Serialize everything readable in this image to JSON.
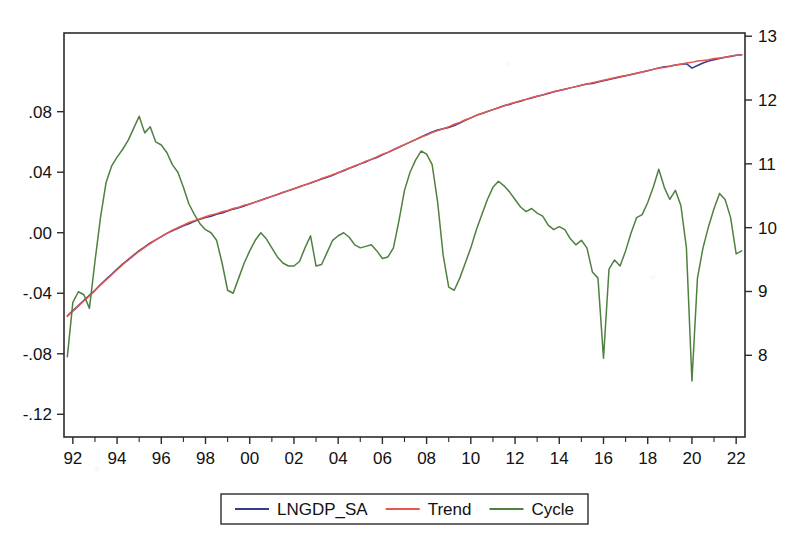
{
  "chart_data": {
    "type": "line",
    "title": "",
    "subtitle": "",
    "xlabel": "",
    "ylabel": "",
    "grid": false,
    "legend_position": "bottom-center",
    "x": [
      1991.75,
      1992.0,
      1992.25,
      1992.5,
      1992.75,
      1993.0,
      1993.25,
      1993.5,
      1993.75,
      1994.0,
      1994.25,
      1994.5,
      1994.75,
      1995.0,
      1995.25,
      1995.5,
      1995.75,
      1996.0,
      1996.25,
      1996.5,
      1996.75,
      1997.0,
      1997.25,
      1997.5,
      1997.75,
      1998.0,
      1998.25,
      1998.5,
      1998.75,
      1999.0,
      1999.25,
      1999.5,
      1999.75,
      2000.0,
      2000.25,
      2000.5,
      2000.75,
      2001.0,
      2001.25,
      2001.5,
      2001.75,
      2002.0,
      2002.25,
      2002.5,
      2002.75,
      2003.0,
      2003.25,
      2003.5,
      2003.75,
      2004.0,
      2004.25,
      2004.5,
      2004.75,
      2005.0,
      2005.25,
      2005.5,
      2005.75,
      2006.0,
      2006.25,
      2006.5,
      2006.75,
      2007.0,
      2007.25,
      2007.5,
      2007.75,
      2008.0,
      2008.25,
      2008.5,
      2008.75,
      2009.0,
      2009.25,
      2009.5,
      2009.75,
      2010.0,
      2010.25,
      2010.5,
      2010.75,
      2011.0,
      2011.25,
      2011.5,
      2011.75,
      2012.0,
      2012.25,
      2012.5,
      2012.75,
      2013.0,
      2013.25,
      2013.5,
      2013.75,
      2014.0,
      2014.25,
      2014.5,
      2014.75,
      2015.0,
      2015.25,
      2015.5,
      2015.75,
      2016.0,
      2016.25,
      2016.5,
      2016.75,
      2017.0,
      2017.25,
      2017.5,
      2017.75,
      2018.0,
      2018.25,
      2018.5,
      2018.75,
      2019.0,
      2019.25,
      2019.5,
      2019.75,
      2020.0,
      2020.25,
      2020.5,
      2020.75,
      2021.0,
      2021.25,
      2021.5,
      2021.75,
      2022.0,
      2022.25
    ],
    "x_axis": {
      "ticks": [
        "92",
        "94",
        "96",
        "98",
        "00",
        "02",
        "04",
        "06",
        "08",
        "10",
        "12",
        "14",
        "16",
        "18",
        "20",
        "22"
      ],
      "tick_values": [
        1992,
        1994,
        1996,
        1998,
        2000,
        2002,
        2004,
        2006,
        2008,
        2010,
        2012,
        2014,
        2016,
        2018,
        2020,
        2022
      ],
      "range": [
        1991.6,
        2022.4
      ],
      "minor_ticks_per_interval": 2
    },
    "y_axis_left": {
      "label": "",
      "ticks": [
        ".08",
        ".04",
        ".00",
        "-.04",
        "-.08",
        "-.12"
      ],
      "tick_values": [
        0.08,
        0.04,
        0.0,
        -0.04,
        -0.08,
        -0.12
      ],
      "range": [
        -0.135,
        0.132
      ],
      "applies_to": [
        "Cycle"
      ]
    },
    "y_axis_right": {
      "label": "",
      "ticks": [
        "13",
        "12",
        "11",
        "10",
        "9",
        "8"
      ],
      "tick_values": [
        13,
        12,
        11,
        10,
        9,
        8
      ],
      "range": [
        6.72,
        13.05
      ],
      "applies_to": [
        "LNGDP_SA",
        "Trend"
      ]
    },
    "series": [
      {
        "name": "LNGDP_SA",
        "color": "#3a3a8c",
        "axis": "right",
        "values": [
          8.62,
          8.7,
          8.78,
          8.86,
          8.94,
          9.02,
          9.11,
          9.19,
          9.27,
          9.35,
          9.43,
          9.5,
          9.57,
          9.64,
          9.7,
          9.76,
          9.81,
          9.86,
          9.91,
          9.95,
          9.99,
          10.03,
          10.06,
          10.1,
          10.13,
          10.16,
          10.18,
          10.21,
          10.23,
          10.26,
          10.29,
          10.31,
          10.34,
          10.37,
          10.4,
          10.43,
          10.46,
          10.49,
          10.52,
          10.55,
          10.58,
          10.61,
          10.64,
          10.67,
          10.7,
          10.73,
          10.76,
          10.79,
          10.82,
          10.86,
          10.89,
          10.93,
          10.96,
          11.0,
          11.03,
          11.07,
          11.1,
          11.14,
          11.18,
          11.22,
          11.26,
          11.3,
          11.34,
          11.38,
          11.42,
          11.46,
          11.5,
          11.53,
          11.55,
          11.57,
          11.6,
          11.64,
          11.68,
          11.72,
          11.76,
          11.79,
          11.82,
          11.85,
          11.88,
          11.91,
          11.93,
          11.96,
          11.98,
          12.01,
          12.03,
          12.06,
          12.08,
          12.1,
          12.13,
          12.15,
          12.17,
          12.19,
          12.21,
          12.23,
          12.25,
          12.26,
          12.28,
          12.3,
          12.32,
          12.34,
          12.36,
          12.38,
          12.4,
          12.42,
          12.44,
          12.46,
          12.48,
          12.5,
          12.52,
          12.53,
          12.55,
          12.56,
          12.57,
          12.5,
          12.54,
          12.58,
          12.61,
          12.63,
          12.65,
          12.67,
          12.68,
          12.7,
          12.71
        ]
      },
      {
        "name": "Trend",
        "color": "#e4584f",
        "axis": "right",
        "values": [
          8.61,
          8.69,
          8.77,
          8.85,
          8.93,
          9.01,
          9.1,
          9.18,
          9.26,
          9.34,
          9.42,
          9.49,
          9.56,
          9.63,
          9.69,
          9.75,
          9.81,
          9.86,
          9.91,
          9.96,
          10.0,
          10.04,
          10.08,
          10.11,
          10.14,
          10.17,
          10.2,
          10.22,
          10.25,
          10.27,
          10.3,
          10.32,
          10.35,
          10.37,
          10.4,
          10.43,
          10.46,
          10.49,
          10.52,
          10.55,
          10.58,
          10.61,
          10.64,
          10.67,
          10.7,
          10.73,
          10.77,
          10.8,
          10.83,
          10.86,
          10.9,
          10.93,
          10.97,
          11.0,
          11.04,
          11.07,
          11.11,
          11.15,
          11.18,
          11.22,
          11.26,
          11.3,
          11.34,
          11.38,
          11.42,
          11.45,
          11.49,
          11.52,
          11.55,
          11.58,
          11.62,
          11.65,
          11.69,
          11.72,
          11.76,
          11.79,
          11.82,
          11.85,
          11.88,
          11.91,
          11.94,
          11.96,
          11.99,
          12.01,
          12.04,
          12.06,
          12.08,
          12.11,
          12.13,
          12.15,
          12.17,
          12.19,
          12.21,
          12.23,
          12.25,
          12.27,
          12.29,
          12.31,
          12.33,
          12.35,
          12.37,
          12.38,
          12.4,
          12.42,
          12.44,
          12.46,
          12.48,
          12.5,
          12.51,
          12.53,
          12.55,
          12.56,
          12.58,
          12.59,
          12.61,
          12.62,
          12.63,
          12.65,
          12.66,
          12.67,
          12.69,
          12.7,
          12.71
        ]
      },
      {
        "name": "Cycle",
        "color": "#4f8040",
        "axis": "left",
        "values": [
          -0.082,
          -0.046,
          -0.039,
          -0.041,
          -0.05,
          -0.019,
          0.01,
          0.033,
          0.044,
          0.05,
          0.055,
          0.061,
          0.069,
          0.077,
          0.066,
          0.07,
          0.06,
          0.058,
          0.053,
          0.045,
          0.04,
          0.03,
          0.019,
          0.012,
          0.006,
          0.002,
          0.0,
          -0.005,
          -0.02,
          -0.038,
          -0.04,
          -0.03,
          -0.02,
          -0.012,
          -0.005,
          0.0,
          -0.004,
          -0.01,
          -0.016,
          -0.02,
          -0.022,
          -0.022,
          -0.019,
          -0.01,
          -0.002,
          -0.022,
          -0.021,
          -0.013,
          -0.005,
          -0.002,
          0.0,
          -0.003,
          -0.008,
          -0.01,
          -0.009,
          -0.008,
          -0.012,
          -0.017,
          -0.016,
          -0.01,
          0.008,
          0.028,
          0.04,
          0.048,
          0.054,
          0.052,
          0.045,
          0.02,
          -0.015,
          -0.036,
          -0.038,
          -0.03,
          -0.02,
          -0.01,
          0.002,
          0.012,
          0.022,
          0.03,
          0.034,
          0.031,
          0.027,
          0.022,
          0.017,
          0.014,
          0.016,
          0.013,
          0.011,
          0.005,
          0.002,
          0.004,
          0.002,
          -0.004,
          -0.008,
          -0.005,
          -0.01,
          -0.026,
          -0.03,
          -0.083,
          -0.024,
          -0.018,
          -0.022,
          -0.012,
          0.0,
          0.01,
          0.012,
          0.02,
          0.03,
          0.042,
          0.03,
          0.022,
          0.028,
          0.018,
          -0.01,
          -0.098,
          -0.03,
          -0.01,
          0.004,
          0.016,
          0.026,
          0.022,
          0.01,
          -0.014,
          -0.012
        ]
      }
    ],
    "legend": [
      {
        "label": "LNGDP_SA",
        "color": "#3a3a8c"
      },
      {
        "label": "Trend",
        "color": "#e4584f"
      },
      {
        "label": "Cycle",
        "color": "#4f8040"
      }
    ]
  }
}
